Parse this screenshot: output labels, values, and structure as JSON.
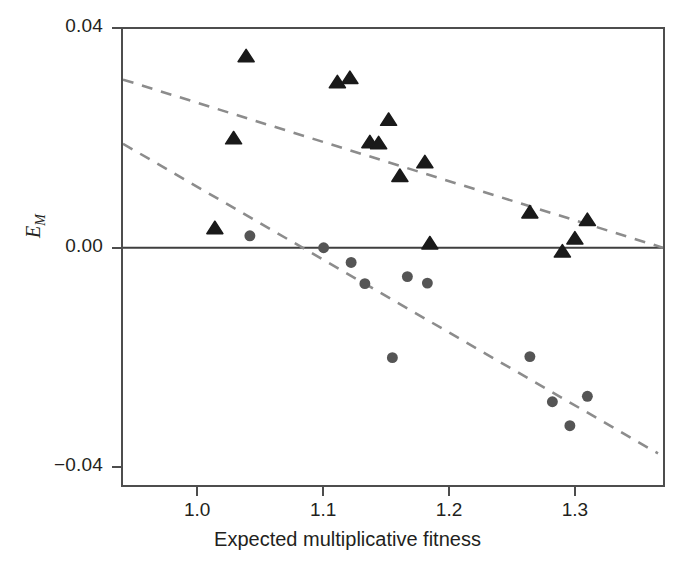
{
  "chart_data": {
    "type": "scatter",
    "title": "",
    "xlabel": "Expected multiplicative fitness",
    "ylabel": "E_M",
    "ylabel_base": "E",
    "ylabel_sub": "M",
    "xlim": [
      0.9395,
      1.3715
    ],
    "ylim": [
      -0.0436,
      0.0402
    ],
    "xticks": [
      1.0,
      1.1,
      1.2,
      1.3
    ],
    "xtick_labels": [
      "1.0",
      "1.1",
      "1.2",
      "1.3"
    ],
    "yticks": [
      0.04,
      0.0,
      -0.04
    ],
    "ytick_labels": [
      "0.04",
      "0.00",
      "−0.04"
    ],
    "grid": false,
    "legend": "none",
    "zero_line": {
      "y": 0.0,
      "color": "#3f3f3f",
      "style": "solid"
    },
    "series": [
      {
        "name": "triangles",
        "marker": "triangle",
        "color": "#1a1a1a",
        "size": 13,
        "points": [
          {
            "x": 1.013,
            "y": 0.0036
          },
          {
            "x": 1.028,
            "y": 0.0201
          },
          {
            "x": 1.038,
            "y": 0.0352
          },
          {
            "x": 1.111,
            "y": 0.0304
          },
          {
            "x": 1.121,
            "y": 0.0312
          },
          {
            "x": 1.137,
            "y": 0.0194
          },
          {
            "x": 1.144,
            "y": 0.0192
          },
          {
            "x": 1.152,
            "y": 0.0235
          },
          {
            "x": 1.161,
            "y": 0.0132
          },
          {
            "x": 1.181,
            "y": 0.0157
          },
          {
            "x": 1.185,
            "y": 0.0008
          },
          {
            "x": 1.265,
            "y": 0.0065
          },
          {
            "x": 1.291,
            "y": -0.0007
          },
          {
            "x": 1.301,
            "y": 0.0017
          },
          {
            "x": 1.311,
            "y": 0.0051
          }
        ]
      },
      {
        "name": "circles",
        "marker": "circle",
        "color": "#555555",
        "size": 11,
        "points": [
          {
            "x": 1.041,
            "y": 0.0022
          },
          {
            "x": 1.1,
            "y": 0.0
          },
          {
            "x": 1.122,
            "y": -0.0027
          },
          {
            "x": 1.133,
            "y": -0.0066
          },
          {
            "x": 1.155,
            "y": -0.0202
          },
          {
            "x": 1.167,
            "y": -0.0053
          },
          {
            "x": 1.183,
            "y": -0.0065
          },
          {
            "x": 1.265,
            "y": -0.02
          },
          {
            "x": 1.283,
            "y": -0.0283
          },
          {
            "x": 1.297,
            "y": -0.0327
          },
          {
            "x": 1.311,
            "y": -0.0273
          }
        ]
      }
    ],
    "trend_lines": [
      {
        "name": "triangle-trend",
        "style": "dashed",
        "color": "#8c8c8c",
        "x0": 0.9395,
        "y0": 0.0309,
        "x1": 1.3715,
        "y1": 0.0
      },
      {
        "name": "circle-trend",
        "style": "dashed",
        "color": "#8c8c8c",
        "x0": 0.9395,
        "y0": 0.0191,
        "x1": 1.3675,
        "y1": -0.0378
      }
    ]
  },
  "axes": {
    "x_title": "Expected multiplicative fitness",
    "y_title_base": "E",
    "y_title_sub": "M",
    "x_tick_labels": [
      "1.0",
      "1.1",
      "1.2",
      "1.3"
    ],
    "y_tick_labels": [
      "0.04",
      "0.00",
      "−0.04"
    ]
  },
  "colors": {
    "triangle": "#1a1a1a",
    "circle": "#555555",
    "trend": "#8c8c8c",
    "frame": "#4d4d4d",
    "text": "#231f20",
    "background": "#ffffff"
  }
}
